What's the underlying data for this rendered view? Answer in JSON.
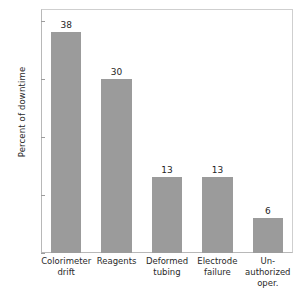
{
  "chart_data": {
    "type": "bar",
    "title": "",
    "xlabel": "",
    "ylabel": "Percent of downtime",
    "categories": [
      "Colorimeter drift",
      "Reagents",
      "Deformed tubing",
      "Electrode failure",
      "Un-authorized oper."
    ],
    "category_lines": [
      [
        "Colorimeter",
        "drift"
      ],
      [
        "Reagents"
      ],
      [
        "Deformed",
        "tubing"
      ],
      [
        "Electrode",
        "failure"
      ],
      [
        "Un-",
        "authorized",
        "oper."
      ]
    ],
    "values": [
      38,
      30,
      13,
      13,
      6
    ],
    "value_labels": [
      "38",
      "30",
      "13",
      "13",
      "6"
    ],
    "ylim": [
      0,
      42
    ],
    "yticks": [
      0,
      10,
      20,
      30,
      40
    ],
    "ytick_labels": [
      "0",
      "10",
      "20",
      "30",
      "40"
    ],
    "grid": false,
    "legend": false,
    "legend_position": "none",
    "bar_color": "#9b9b9b",
    "frame_color": "#c4c4c4",
    "text_color": "#1f1f1f"
  }
}
